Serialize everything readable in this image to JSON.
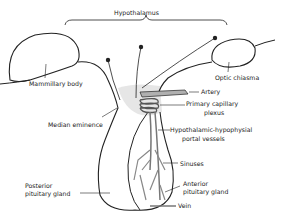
{
  "diagram": {
    "labels": {
      "hypothalamus": "Hypothalamus",
      "mammillary_body": "Mammillary body",
      "optic_chiasma": "Optic chiasma",
      "artery": "Artery",
      "primary_capillary_plexus_1": "Primary capillary",
      "primary_capillary_plexus_2": "plexus",
      "median_eminence": "Median eminence",
      "portal_vessels_1": "Hypothalamic-hypophysial",
      "portal_vessels_2": "portal vessels",
      "sinuses": "Sinuses",
      "posterior_pituitary_1": "Posterior",
      "posterior_pituitary_2": "pituitary gland",
      "anterior_pituitary_1": "Anterior",
      "anterior_pituitary_2": "pituitary gland",
      "vein": "Vein"
    },
    "colors": {
      "line": "#222222",
      "shade": "#e6e6e6",
      "vessel": "#9a9a9a"
    }
  }
}
